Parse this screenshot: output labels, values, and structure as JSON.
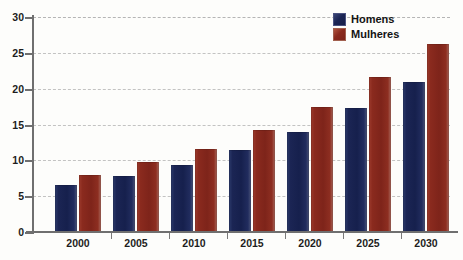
{
  "chart_data": {
    "type": "bar",
    "title": "",
    "xlabel": "",
    "ylabel": "",
    "categories": [
      "2000",
      "2005",
      "2010",
      "2015",
      "2020",
      "2025",
      "2030"
    ],
    "series": [
      {
        "name": "Homens",
        "color": "#1b2554",
        "values": [
          6.5,
          7.8,
          9.3,
          11.5,
          13.9,
          17.3,
          20.9
        ]
      },
      {
        "name": "Mulheres",
        "color": "#8a2a1e",
        "values": [
          8.0,
          9.7,
          11.6,
          14.3,
          17.5,
          21.6,
          26.2
        ]
      }
    ],
    "ylim": [
      0,
      30
    ],
    "y_ticks": [
      0,
      5,
      10,
      15,
      20,
      25,
      30
    ],
    "y_tick_labels": [
      "0",
      "5",
      "10",
      "15",
      "20",
      "25",
      "30"
    ],
    "grid": true,
    "grid_style": "dashed",
    "legend_position": "top-right"
  },
  "legend": {
    "items": [
      {
        "label": "Homens"
      },
      {
        "label": "Mulheres"
      }
    ]
  },
  "axis": {
    "y_labels": [
      "30",
      "25",
      "20",
      "15",
      "10",
      "5",
      "0"
    ],
    "x_labels": [
      "2000",
      "2005",
      "2010",
      "2015",
      "2020",
      "2025",
      "2030"
    ]
  }
}
